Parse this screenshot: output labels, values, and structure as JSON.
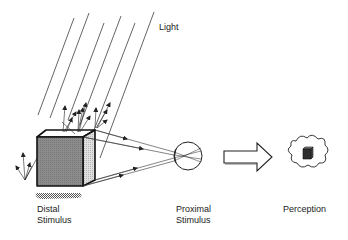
{
  "diagram": {
    "labels": {
      "light": "Light",
      "distal_line1": "Distal",
      "distal_line2": "Stimulus",
      "proximal_line1": "Proximal",
      "proximal_line2": "Stimulus",
      "perception": "Perception"
    },
    "elements": [
      {
        "id": "light-rays",
        "shape": "parallel diagonal lines",
        "count": 6
      },
      {
        "id": "distal-cube",
        "shape": "shaded cube with cast shadow"
      },
      {
        "id": "reflected-arrows",
        "shape": "scattered arrows from cube top and left"
      },
      {
        "id": "projection-rays",
        "shape": "lines with arrowheads from cube to eye",
        "count": 4
      },
      {
        "id": "eye",
        "shape": "circle with lens and crossing rays"
      },
      {
        "id": "process-arrow",
        "shape": "hollow block arrow"
      },
      {
        "id": "thought-cloud",
        "shape": "cloud containing small dark cube"
      }
    ],
    "colors": {
      "line": "#222222",
      "cube_front": "#8a8a8a",
      "cube_side": "#d0d0d0",
      "cube_top": "#ffffff",
      "shadow": "#9a9a9a",
      "mini_cube": "#3a3a3a"
    }
  }
}
